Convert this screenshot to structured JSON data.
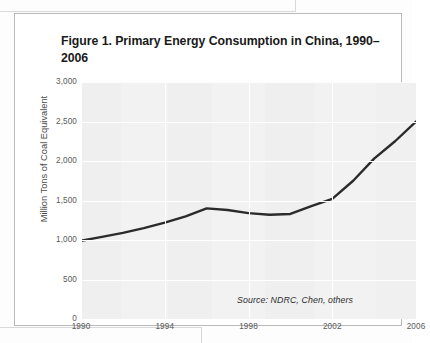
{
  "figure": {
    "title": "Figure 1. Primary Energy Consumption in China, 1990–2006",
    "source_note": "Source: NDRC, Chen, others",
    "border_color": "#b9b9b9",
    "plot_background": "#f2f2f2",
    "gridline_color": "#ffffff",
    "line_color": "#2b2b2b"
  },
  "chart_data": {
    "type": "line",
    "title": "Figure 1. Primary Energy Consumption in China, 1990–2006",
    "xlabel": "",
    "ylabel": "Million Tons of Coal Equivalent",
    "xlim": [
      1990,
      2006
    ],
    "ylim": [
      0,
      3000
    ],
    "grid": true,
    "legend": "none",
    "annotations": [
      "Source: NDRC, Chen, others"
    ],
    "ytick_labels": [
      "0",
      "500",
      "1,000",
      "1,500",
      "2,000",
      "2,500",
      "3,000"
    ],
    "ytick_values": [
      0,
      500,
      1000,
      1500,
      2000,
      2500,
      3000
    ],
    "xtick_labels": [
      "1990",
      "1994",
      "1998",
      "2002",
      "2006"
    ],
    "xtick_values": [
      1990,
      1994,
      1998,
      2002,
      2006
    ],
    "x": [
      1990,
      1991,
      1992,
      1993,
      1994,
      1995,
      1996,
      1997,
      1998,
      1999,
      2000,
      2001,
      2002,
      2003,
      2004,
      2005,
      2006
    ],
    "series": [
      {
        "name": "Primary energy consumption",
        "unit": "million tons of coal equivalent",
        "values": [
          990,
          1040,
          1090,
          1150,
          1220,
          1300,
          1400,
          1380,
          1340,
          1320,
          1330,
          1430,
          1520,
          1750,
          2030,
          2250,
          2500
        ]
      }
    ]
  }
}
